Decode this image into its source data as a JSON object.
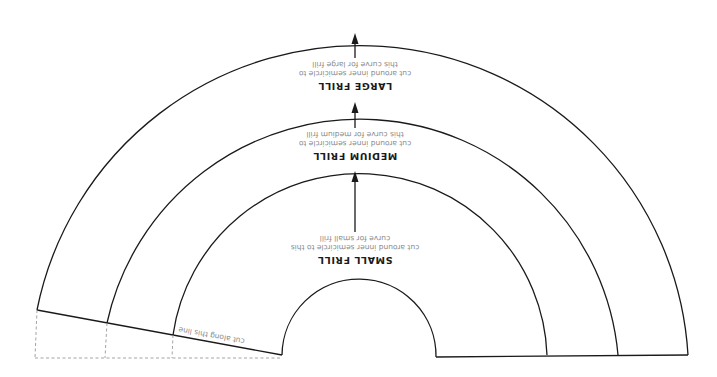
{
  "frills": [
    {
      "name": "LARGE FRILL",
      "instruction_line1": "cut around inner semicircle to",
      "instruction_line2": "this curve for large frill"
    },
    {
      "name": "MEDIUM FRILL",
      "instruction_line1": "cut around inner semicircle to",
      "instruction_line2": "this curve for medium frill"
    },
    {
      "name": "SMALL FRILL",
      "instruction_line1": "cut around inner semicircle to this",
      "instruction_line2": "curve for small frill"
    }
  ],
  "cut_line_label": "cut along this line",
  "colors": {
    "line": "#1a1a1a",
    "dashed": "#999999",
    "hint_text": "#8a8a8a"
  }
}
